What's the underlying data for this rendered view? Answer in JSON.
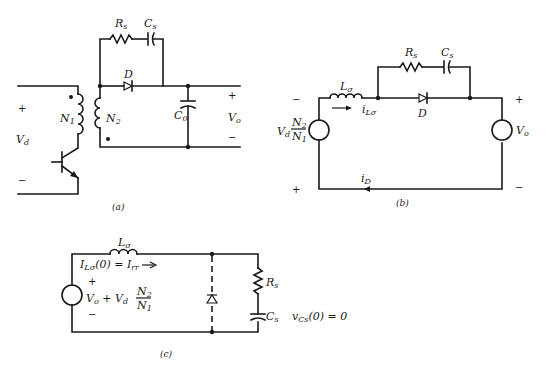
{
  "figure": {
    "panels": [
      {
        "id": "a",
        "caption": "(a)",
        "labels": {
          "rs": "R",
          "rs_sub": "s",
          "cs": "C",
          "cs_sub": "s",
          "diode": "D",
          "n1": "N",
          "n1_sub": "1",
          "n2": "N",
          "n2_sub": "2",
          "c0": "C",
          "c0_sub": "0",
          "vd": "V",
          "vd_sub": "d",
          "vo": "V",
          "vo_sub": "o",
          "plus_left": "+",
          "minus_left": "−",
          "plus_right": "+",
          "minus_right": "−"
        }
      },
      {
        "id": "b",
        "caption": "(b)",
        "labels": {
          "lo": "L",
          "lo_sub": "σ",
          "ilo": "i",
          "ilo_sub": "Lσ",
          "rs": "R",
          "rs_sub": "s",
          "cs": "C",
          "cs_sub": "s",
          "diode": "D",
          "src_left_v": "V",
          "src_left_v_sub": "d",
          "src_left_num": "N",
          "src_left_num_sub": "2",
          "src_left_den": "N",
          "src_left_den_sub": "1",
          "src_right": "V",
          "src_right_sub": "o",
          "id": "i",
          "id_sub": "D",
          "minus_left": "−",
          "plus_left": "+",
          "plus_right": "+",
          "minus_right": "−"
        }
      },
      {
        "id": "c",
        "caption": "(c)",
        "labels": {
          "lo": "L",
          "lo_sub": "σ",
          "init_current": "I",
          "init_current_sub": "Lσ",
          "init_current_rest": "(0) = I",
          "init_current_irr_sub": "rr",
          "src_vo": "V",
          "src_vo_sub": "o",
          "src_plus": " + V",
          "src_vd_sub": "d",
          "src_num": "N",
          "src_num_sub": "2",
          "src_den": "N",
          "src_den_sub": "1",
          "plus": "+",
          "minus": "−",
          "rs": "R",
          "rs_sub": "s",
          "cs": "C",
          "cs_sub": "s",
          "vcs": "v",
          "vcs_sub": "Cs",
          "vcs_rest": "(0) = 0"
        }
      }
    ]
  }
}
